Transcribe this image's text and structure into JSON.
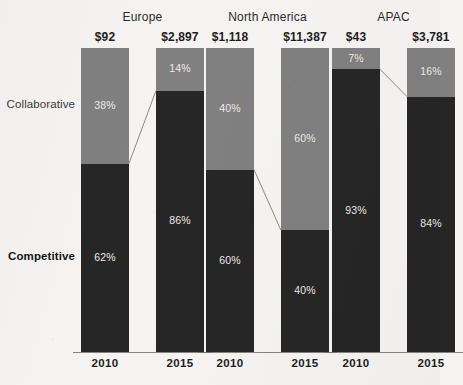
{
  "chart_data": {
    "type": "bar",
    "subtype": "100% stacked column with linked segment connectors",
    "title": "",
    "xlabel": "",
    "ylabel": "",
    "ylim": [
      0,
      100
    ],
    "grid": false,
    "legend_position": "left-axis-inline",
    "categories": [
      "2010",
      "2015"
    ],
    "series": [
      {
        "name": "Collaborative",
        "color": "#808080"
      },
      {
        "name": "Competitive",
        "color": "#262626"
      }
    ],
    "groups": [
      {
        "name": "Europe",
        "bars": [
          {
            "year": "2010",
            "value_label": "$92",
            "collaborative": 38,
            "competitive": 62,
            "collaborative_label": "38%",
            "competitive_label": "62%"
          },
          {
            "year": "2015",
            "value_label": "$2,897",
            "collaborative": 14,
            "competitive": 86,
            "collaborative_label": "14%",
            "competitive_label": "86%"
          }
        ]
      },
      {
        "name": "North America",
        "bars": [
          {
            "year": "2010",
            "value_label": "$1,118",
            "collaborative": 40,
            "competitive": 60,
            "collaborative_label": "40%",
            "competitive_label": "60%"
          },
          {
            "year": "2015",
            "value_label": "$11,387",
            "collaborative": 60,
            "competitive": 40,
            "collaborative_label": "60%",
            "competitive_label": "40%"
          }
        ]
      },
      {
        "name": "APAC",
        "bars": [
          {
            "year": "2010",
            "value_label": "$43",
            "collaborative": 7,
            "competitive": 93,
            "collaborative_label": "7%",
            "competitive_label": "93%"
          },
          {
            "year": "2015",
            "value_label": "$3,781",
            "collaborative": 16,
            "competitive": 84,
            "collaborative_label": "16%",
            "competitive_label": "84%"
          }
        ]
      }
    ]
  },
  "axis_labels": {
    "collaborative": "Collaborative",
    "competitive": "Competitive"
  },
  "colors": {
    "collaborative": "#808080",
    "competitive": "#262626",
    "background": "#f5f4f2",
    "baseline": "#6f6d69",
    "connector": "#8d8b87",
    "text": "#1d1d1d"
  }
}
